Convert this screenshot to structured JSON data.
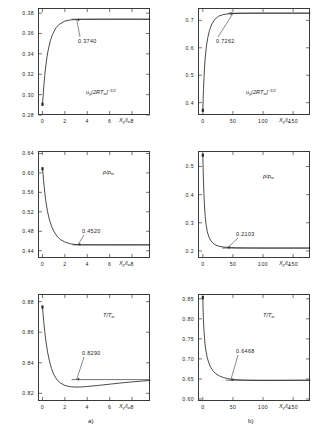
{
  "figure": {
    "captions": [
      {
        "label": "a)"
      },
      {
        "label": "b)"
      }
    ]
  },
  "chart_data": [
    {
      "type": "line",
      "panel": "a-top",
      "title": "",
      "xlabel": "X_y/l_w",
      "ylabel": "u_y(2RT_w)^-1/2",
      "xlim": [
        -0.4,
        9.6
      ],
      "ylim": [
        0.28,
        0.385
      ],
      "xticks": [
        0,
        2,
        4,
        6,
        8
      ],
      "xticklabels": [
        "0",
        "2",
        "4",
        "6",
        "8"
      ],
      "yticks": [
        0.28,
        0.3,
        0.32,
        0.34,
        0.36,
        0.38
      ],
      "yticklabels": [
        "0.28",
        "0.30",
        "0.32",
        "0.34",
        "0.36",
        "0.38"
      ],
      "grid": false,
      "legend": false,
      "annotation": "0.3740",
      "asymptote": 0.374,
      "asymptote_x_start": 2.6,
      "asymptote_x_end": 9.6,
      "curve_x": [
        0.0,
        0.05,
        0.1,
        0.15,
        0.2,
        0.3,
        0.4,
        0.5,
        0.7,
        0.9,
        1.2,
        1.5,
        2.0,
        2.5,
        3.0,
        3.5,
        4.0,
        5.0,
        6.0,
        7.0,
        8.0,
        9.0,
        9.6
      ],
      "curve_y": [
        0.2905,
        0.2975,
        0.3055,
        0.3125,
        0.3185,
        0.3285,
        0.3368,
        0.3432,
        0.3528,
        0.3592,
        0.3655,
        0.369,
        0.3722,
        0.3733,
        0.3737,
        0.3738,
        0.3739,
        0.374,
        0.374,
        0.374,
        0.374,
        0.374,
        0.374
      ],
      "origin_marker": {
        "x": 0.0,
        "y": 0.2905
      }
    },
    {
      "type": "line",
      "panel": "b-top",
      "title": "",
      "xlabel": "X_y/l_w",
      "ylabel": "u_y(2RT_w)^-1/2",
      "xlim": [
        -8,
        178
      ],
      "ylim": [
        0.355,
        0.745
      ],
      "xticks": [
        0,
        50,
        100,
        150
      ],
      "xticklabels": [
        "0",
        "50",
        "100",
        "150"
      ],
      "yticks": [
        0.4,
        0.5,
        0.6,
        0.7
      ],
      "yticklabels": [
        "0.4",
        "0.5",
        "0.6",
        "0.7"
      ],
      "grid": false,
      "legend": false,
      "annotation": "0.7262",
      "asymptote": 0.7262,
      "asymptote_x_start": 42,
      "asymptote_x_end": 178,
      "curve_x": [
        0,
        0.6,
        1.2,
        2,
        3,
        4,
        6,
        8,
        11,
        15,
        20,
        26,
        33,
        40,
        50,
        60,
        75,
        90,
        110,
        130,
        150,
        170,
        178
      ],
      "curve_y": [
        0.372,
        0.415,
        0.452,
        0.492,
        0.533,
        0.563,
        0.606,
        0.634,
        0.663,
        0.687,
        0.704,
        0.715,
        0.7205,
        0.7232,
        0.7248,
        0.7255,
        0.7259,
        0.7261,
        0.7262,
        0.7262,
        0.7262,
        0.7262,
        0.7262
      ],
      "origin_marker": {
        "x": 0.0,
        "y": 0.372
      }
    },
    {
      "type": "line",
      "panel": "a-middle",
      "title": "",
      "xlabel": "X_y/l_w",
      "ylabel": "rho/rho_w",
      "xlim": [
        -0.4,
        9.6
      ],
      "ylim": [
        0.425,
        0.645
      ],
      "xticks": [
        0,
        2,
        4,
        6,
        8
      ],
      "xticklabels": [
        "0",
        "2",
        "4",
        "6",
        "8"
      ],
      "yticks": [
        0.44,
        0.48,
        0.52,
        0.56,
        0.6,
        0.64
      ],
      "yticklabels": [
        "0.44",
        "0.48",
        "0.52",
        "0.56",
        "0.60",
        "0.64"
      ],
      "grid": false,
      "legend": false,
      "annotation": "0.4520",
      "asymptote": 0.452,
      "asymptote_x_start": 2.7,
      "asymptote_x_end": 9.6,
      "curve_x": [
        0.0,
        0.05,
        0.1,
        0.2,
        0.3,
        0.45,
        0.6,
        0.8,
        1.0,
        1.3,
        1.6,
        2.0,
        2.5,
        3.0,
        3.5,
        4.0,
        5.0,
        6.0,
        7.0,
        8.0,
        9.0,
        9.6
      ],
      "curve_y": [
        0.6085,
        0.5975,
        0.5835,
        0.5605,
        0.5415,
        0.5205,
        0.5055,
        0.4905,
        0.4805,
        0.4695,
        0.463,
        0.4578,
        0.454,
        0.4525,
        0.4522,
        0.4521,
        0.452,
        0.452,
        0.452,
        0.452,
        0.452,
        0.452
      ],
      "origin_marker": {
        "x": 0.0,
        "y": 0.6085
      }
    },
    {
      "type": "line",
      "panel": "b-middle",
      "title": "",
      "xlabel": "X_y/l_w",
      "ylabel": "rho/rho_w",
      "xlim": [
        -8,
        178
      ],
      "ylim": [
        0.175,
        0.555
      ],
      "xticks": [
        0,
        50,
        100,
        150
      ],
      "xticklabels": [
        "0",
        "50",
        "100",
        "150"
      ],
      "yticks": [
        0.2,
        0.3,
        0.4,
        0.5
      ],
      "yticklabels": [
        "0.2",
        "0.3",
        "0.4",
        "0.5"
      ],
      "grid": false,
      "legend": false,
      "annotation": "0.2103",
      "asymptote": 0.2103,
      "asymptote_x_start": 32,
      "asymptote_x_end": 178,
      "curve_x": [
        0,
        0.5,
        1,
        1.8,
        2.8,
        4,
        5.5,
        7.5,
        10,
        13,
        17,
        22,
        28,
        35,
        45,
        55,
        70,
        90,
        110,
        130,
        150,
        170,
        178
      ],
      "curve_y": [
        0.54,
        0.495,
        0.455,
        0.405,
        0.36,
        0.322,
        0.293,
        0.268,
        0.25,
        0.237,
        0.2275,
        0.2205,
        0.2162,
        0.2138,
        0.212,
        0.2112,
        0.2107,
        0.2104,
        0.2103,
        0.2103,
        0.2103,
        0.2103,
        0.2103
      ],
      "origin_marker": {
        "x": 0.0,
        "y": 0.54
      }
    },
    {
      "type": "line",
      "panel": "a-bottom",
      "title": "",
      "xlabel": "X_y/l_w",
      "ylabel": "T/T_w",
      "xlim": [
        -0.4,
        9.6
      ],
      "ylim": [
        0.815,
        0.885
      ],
      "xticks": [
        0,
        2,
        4,
        6,
        8
      ],
      "xticklabels": [
        "0",
        "2",
        "4",
        "6",
        "8"
      ],
      "yticks": [
        0.82,
        0.84,
        0.86,
        0.88
      ],
      "yticklabels": [
        "0.82",
        "0.84",
        "0.86",
        "0.88"
      ],
      "grid": false,
      "legend": false,
      "annotation": "0.8290",
      "asymptote": 0.829,
      "asymptote_x_start": 2.6,
      "asymptote_x_end": 9.6,
      "curve_x": [
        0.0,
        0.05,
        0.1,
        0.2,
        0.3,
        0.45,
        0.6,
        0.8,
        1.0,
        1.3,
        1.6,
        2.0,
        2.5,
        3.0,
        3.5,
        4.0,
        5.0,
        6.0,
        7.0,
        8.0,
        9.0,
        9.6
      ],
      "curve_y": [
        0.8765,
        0.8722,
        0.8678,
        0.8605,
        0.8545,
        0.8472,
        0.8418,
        0.8362,
        0.8325,
        0.8288,
        0.8268,
        0.8252,
        0.8243,
        0.8241,
        0.8242,
        0.8245,
        0.8252,
        0.826,
        0.8268,
        0.8275,
        0.8281,
        0.8284
      ],
      "origin_marker": {
        "x": 0.0,
        "y": 0.8765
      }
    },
    {
      "type": "line",
      "panel": "b-bottom",
      "title": "",
      "xlabel": "X_y/l_w",
      "ylabel": "T/T_w",
      "xlim": [
        -8,
        178
      ],
      "ylim": [
        0.595,
        0.862
      ],
      "xticks": [
        0,
        50,
        100,
        150
      ],
      "xticklabels": [
        "0",
        "50",
        "100",
        "150"
      ],
      "yticks": [
        0.6,
        0.65,
        0.7,
        0.75,
        0.8,
        0.85
      ],
      "yticklabels": [
        "0.60",
        "0.65",
        "0.70",
        "0.75",
        "0.80",
        "0.85"
      ],
      "grid": false,
      "legend": false,
      "annotation": "0.6468",
      "asymptote": 0.6468,
      "asymptote_x_start": 38,
      "asymptote_x_end": 178,
      "curve_x": [
        0,
        0.5,
        1,
        1.8,
        2.8,
        4,
        5.5,
        7.5,
        10,
        13,
        17,
        22,
        28,
        35,
        45,
        55,
        70,
        90,
        110,
        130,
        150,
        170,
        178
      ],
      "curve_y": [
        0.853,
        0.822,
        0.8,
        0.774,
        0.752,
        0.733,
        0.717,
        0.702,
        0.69,
        0.679,
        0.67,
        0.6625,
        0.6572,
        0.6532,
        0.6498,
        0.6482,
        0.647,
        0.6464,
        0.6463,
        0.6464,
        0.6466,
        0.6468,
        0.6469
      ],
      "origin_marker": {
        "x": 0.0,
        "y": 0.853
      }
    }
  ]
}
